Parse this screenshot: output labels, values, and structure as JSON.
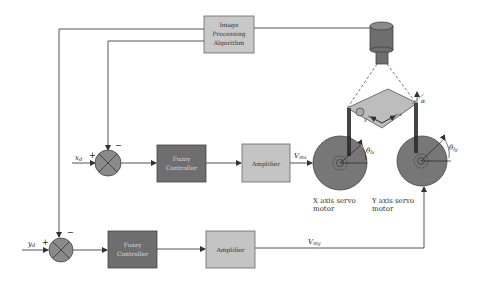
{
  "blocks": {
    "image_processing": {
      "lines": [
        "Image",
        "Processing",
        "Algorithm"
      ]
    },
    "fuzzy_x": {
      "lines": [
        "Fuzzy",
        "Controller"
      ]
    },
    "amplifier_x": {
      "label": "Amplifier"
    },
    "fuzzy_y": {
      "lines": [
        "Fuzzy",
        "Controller"
      ]
    },
    "amplifier_y": {
      "label": "Amplifier"
    }
  },
  "signals": {
    "xd": "x",
    "xd_sub": "d",
    "yd": "y",
    "yd_sub": "d",
    "vmx": "V",
    "vmx_sub": "mx",
    "vmy": "V",
    "vmy_sub": "my",
    "theta_lx": "θ",
    "theta_lx_sub": "lx",
    "theta_ly": "θ",
    "theta_ly_sub": "ly",
    "alpha": "α",
    "platform_x": "x",
    "platform_y": "y"
  },
  "junctions": {
    "x": {
      "plus": "+",
      "minus": "−"
    },
    "y": {
      "plus": "+",
      "minus": "−"
    }
  },
  "motors": {
    "x": {
      "caption_line1": "X   axis   servo",
      "caption_line2": "motor"
    },
    "y": {
      "caption_line1": "Y   axis   servo",
      "caption_line2": "motor"
    }
  },
  "colors": {
    "fuzzy_fill": "#6e6e6e",
    "amplifier_fill": "#c4c4c4",
    "image_proc_fill": "#c8c8c8",
    "motor_fill": "#777777",
    "junction_fill": "#8a8a8a",
    "platform_fill": "#bdbdbd",
    "wire": "#555555"
  }
}
